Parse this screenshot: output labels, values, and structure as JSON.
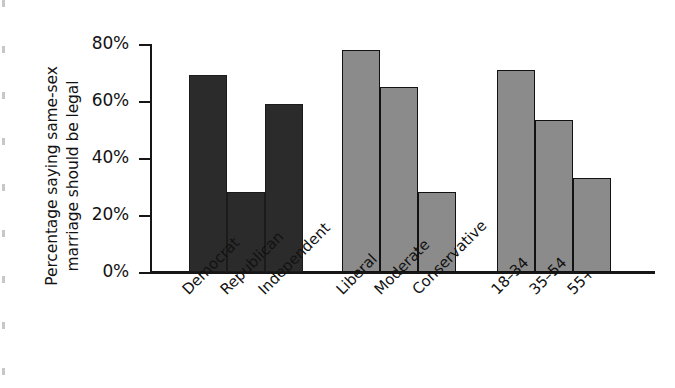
{
  "chart_data": {
    "type": "bar",
    "title": "",
    "xlabel": "",
    "ylabel": "Percentage saying same-sex marriage should be legal",
    "ylim": [
      0,
      80
    ],
    "grid": false,
    "legend": "none",
    "ytick_labels": [
      "80%",
      "60%",
      "40%",
      "20%",
      "0%"
    ],
    "ytick_values": [
      80,
      60,
      40,
      20,
      0
    ],
    "categories": [
      "Democrat",
      "Republican",
      "Independent",
      "Liberal",
      "Moderate",
      "Conservative",
      "18–34",
      "35–54",
      "55+"
    ],
    "values": [
      69,
      28,
      59,
      78,
      65,
      28,
      71,
      53.5,
      33
    ],
    "groups": [
      {
        "name": "party",
        "color": "#2b2b2b",
        "bars": [
          {
            "label": "Democrat",
            "value": 69
          },
          {
            "label": "Republican",
            "value": 28
          },
          {
            "label": "Independent",
            "value": 59
          }
        ]
      },
      {
        "name": "ideology",
        "color": "#8b8b8b",
        "bars": [
          {
            "label": "Liberal",
            "value": 78
          },
          {
            "label": "Moderate",
            "value": 65
          },
          {
            "label": "Conservative",
            "value": 28
          }
        ]
      },
      {
        "name": "age",
        "color": "#8b8b8b",
        "bars": [
          {
            "label": "18–34",
            "value": 71
          },
          {
            "label": "35–54",
            "value": 53.5
          },
          {
            "label": "55+",
            "value": 33
          }
        ]
      }
    ]
  },
  "colors": {
    "dark_bar": "#2b2b2b",
    "gray_bar": "#8b8b8b",
    "axis": "#161616",
    "background": "#ffffff"
  }
}
